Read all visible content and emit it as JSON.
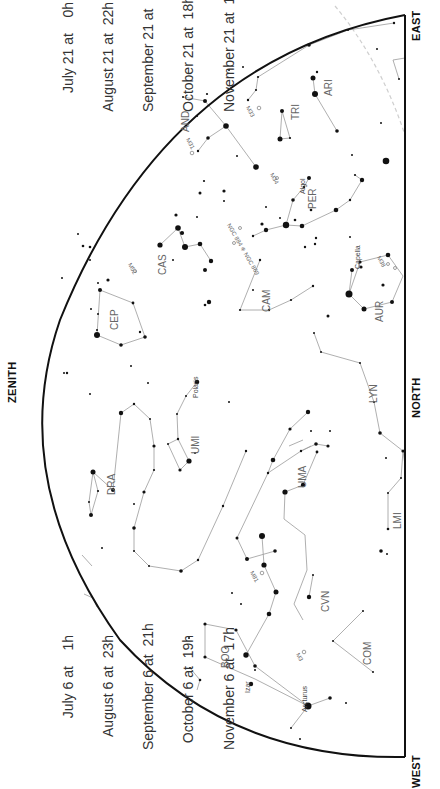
{
  "time_blocks": {
    "top": [
      "July 21 at    0h",
      "August 21 at  22h",
      "September 21 at  20h",
      "October 21 at  18h",
      "November 21 at  16h"
    ],
    "bottom": [
      "July 6 at    1h",
      "August 6 at  23h",
      "September 6 at  21h",
      "October 6 at  19h",
      "November 6 at  17h"
    ]
  },
  "directions": {
    "east": "EAST",
    "north": "NORTH",
    "west": "WEST",
    "zenith": "ZENITH"
  },
  "colors": {
    "horizon": "#111111",
    "lines": "#9a9a9a",
    "stars": "#111111",
    "labels": "#555555",
    "ecliptic": "#cccccc"
  },
  "constellations": [
    {
      "abbr": "AND",
      "x": 186,
      "y": 122
    },
    {
      "abbr": "TRI",
      "x": 296,
      "y": 110
    },
    {
      "abbr": "ARI",
      "x": 329,
      "y": 86
    },
    {
      "abbr": "PER",
      "x": 313,
      "y": 199
    },
    {
      "abbr": "CAS",
      "x": 163,
      "y": 265
    },
    {
      "abbr": "CEP",
      "x": 115,
      "y": 320
    },
    {
      "abbr": "CAM",
      "x": 267,
      "y": 302
    },
    {
      "abbr": "AUR",
      "x": 380,
      "y": 312
    },
    {
      "abbr": "LYN",
      "x": 374,
      "y": 393
    },
    {
      "abbr": "UMI",
      "x": 196,
      "y": 444
    },
    {
      "abbr": "DRA",
      "x": 112,
      "y": 485
    },
    {
      "abbr": "UMA",
      "x": 303,
      "y": 478
    },
    {
      "abbr": "LMI",
      "x": 398,
      "y": 519
    },
    {
      "abbr": "CVN",
      "x": 326,
      "y": 602
    },
    {
      "abbr": "BOO",
      "x": 226,
      "y": 658
    },
    {
      "abbr": "COM",
      "x": 368,
      "y": 655
    }
  ],
  "star_names": [
    {
      "name": "Algol",
      "x": 303,
      "y": 180
    },
    {
      "name": "Capella",
      "x": 358,
      "y": 255
    },
    {
      "name": "Polaris",
      "x": 196,
      "y": 384
    },
    {
      "name": "Arcturus",
      "x": 305,
      "y": 698
    },
    {
      "name": "Izar",
      "x": 248,
      "y": 679
    }
  ],
  "deep_sky": [
    {
      "name": "M33",
      "x": 250,
      "y": 105
    },
    {
      "name": "M31",
      "x": 190,
      "y": 137
    },
    {
      "name": "M34",
      "x": 274,
      "y": 172
    },
    {
      "name": "NGC 884 ⁜ NGC 869",
      "x": 232,
      "y": 222
    },
    {
      "name": "M52",
      "x": 132,
      "y": 262
    },
    {
      "name": "M38",
      "x": 381,
      "y": 255
    },
    {
      "name": "M81",
      "x": 254,
      "y": 570
    },
    {
      "name": "M3",
      "x": 300,
      "y": 652
    }
  ]
}
